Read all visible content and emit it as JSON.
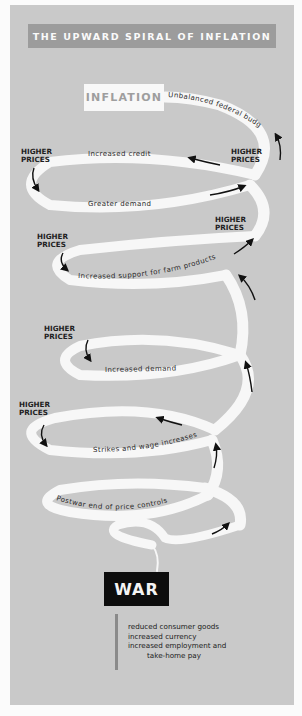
{
  "title": "THE UPWARD SPIRAL OF INFLATION",
  "top_box": "INFLATION",
  "bottom_box": "WAR",
  "spiral_labels": {
    "unbalanced_budget": "Unbalanced federal budget",
    "increased_credit": "Increased credit",
    "greater_demand": "Greater demand",
    "farm_support": "Increased support for farm products",
    "increased_demand": "Increased demand",
    "strikes_wages": "Strikes and wage increases",
    "postwar_controls": "Postwar end of price controls"
  },
  "higher_prices": {
    "line1": "HIGHER",
    "line2": "PRICES"
  },
  "war_causes": [
    "reduced consumer goods",
    "increased currency",
    "increased employment and",
    "take-home pay"
  ],
  "colors": {
    "background_panel": "#c9c9c9",
    "title_bar": "#9c9c9c",
    "spiral": "#f7f7f7",
    "war_box": "#0d0d0d"
  }
}
